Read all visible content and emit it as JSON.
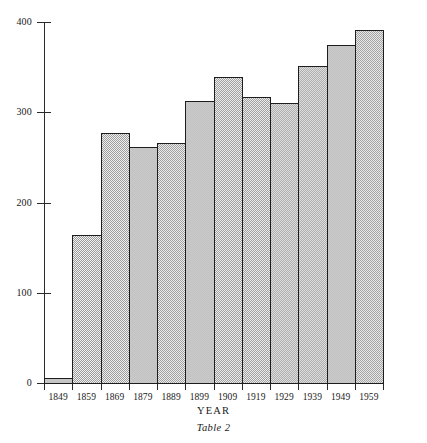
{
  "caption": "Table 2",
  "chart_data": {
    "type": "bar",
    "title": "",
    "subtitle": "",
    "xlabel": "YEAR",
    "ylabel": "",
    "categories": [
      "1849",
      "1859",
      "1869",
      "1879",
      "1889",
      "1899",
      "1909",
      "1919",
      "1929",
      "1939",
      "1949",
      "1959"
    ],
    "values": [
      5,
      164,
      277,
      262,
      266,
      313,
      339,
      317,
      310,
      351,
      374,
      391
    ],
    "series": [
      {
        "name": "",
        "values": [
          5,
          164,
          277,
          262,
          266,
          313,
          339,
          317,
          310,
          351,
          374,
          391
        ]
      }
    ],
    "ylim": [
      0,
      400
    ],
    "yticks": [
      0,
      100,
      200,
      300,
      400
    ],
    "ytick_labels": [
      "0",
      "100",
      "200",
      "300",
      "400"
    ],
    "xtick_labels": [
      "1849",
      "1859",
      "1869",
      "1879",
      "1889",
      "1899",
      "1909",
      "1919",
      "1929",
      "1939",
      "1949",
      "1959"
    ],
    "grid": false,
    "legend": false,
    "legend_position": "none",
    "bar_fill_color": "#d4d4d4",
    "bar_edge_color": "#1d1d1d",
    "axis_color": "#2a2a2a",
    "background_color": "#ffffff"
  }
}
